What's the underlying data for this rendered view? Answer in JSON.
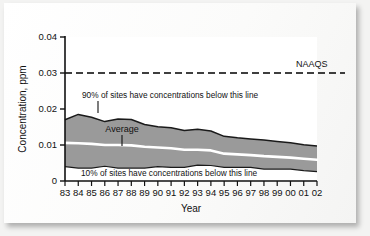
{
  "figure": {
    "background_color": "#f3f3f2",
    "card_color": "#fdfdfd",
    "plot_background": "#ffffff"
  },
  "chart_data": {
    "type": "area",
    "title": "",
    "subtitle": "",
    "xlabel": "Year",
    "ylabel": "Concentration, ppm",
    "xlim": [
      83,
      102
    ],
    "ylim": [
      0,
      0.04
    ],
    "grid": false,
    "legend_position": "none",
    "x": [
      "83",
      "84",
      "85",
      "86",
      "87",
      "88",
      "89",
      "90",
      "91",
      "92",
      "93",
      "94",
      "95",
      "96",
      "97",
      "98",
      "99",
      "00",
      "01",
      "02"
    ],
    "x_numeric": [
      1983,
      1984,
      1985,
      1986,
      1987,
      1988,
      1989,
      1990,
      1991,
      1992,
      1993,
      1994,
      1995,
      1996,
      1997,
      1998,
      1999,
      2000,
      2001,
      2002
    ],
    "y_ticks": [
      "0",
      "0.01",
      "0.02",
      "0.03",
      "0.04"
    ],
    "y_tick_values": [
      0,
      0.01,
      0.02,
      0.03,
      0.04
    ],
    "band_fill_color": "#9a9a9a",
    "band_edge_color": "#1a1a1a",
    "average_line_color": "#ffffff",
    "series": [
      {
        "name": "90% of sites have concentrations below this line",
        "role": "upper-percentile",
        "values": [
          0.017,
          0.0185,
          0.0177,
          0.0165,
          0.0172,
          0.0171,
          0.0157,
          0.0151,
          0.0148,
          0.014,
          0.0144,
          0.0139,
          0.0124,
          0.012,
          0.0117,
          0.0114,
          0.011,
          0.0106,
          0.0101,
          0.0097
        ]
      },
      {
        "name": "Average",
        "role": "mean",
        "values": [
          0.0106,
          0.0105,
          0.0103,
          0.01,
          0.01,
          0.0099,
          0.0095,
          0.0093,
          0.0091,
          0.0087,
          0.0087,
          0.0085,
          0.0076,
          0.0074,
          0.0072,
          0.0069,
          0.0067,
          0.0065,
          0.0062,
          0.0059
        ]
      },
      {
        "name": "10% of sites have concentrations below this line",
        "role": "lower-percentile",
        "values": [
          0.004,
          0.0036,
          0.0036,
          0.0041,
          0.0036,
          0.0036,
          0.0036,
          0.004,
          0.0038,
          0.0038,
          0.0044,
          0.0043,
          0.0038,
          0.0038,
          0.0038,
          0.0033,
          0.0033,
          0.0033,
          0.0029,
          0.0026
        ]
      }
    ],
    "reference_lines": [
      {
        "name": "NAAQS",
        "label": "NAAQS",
        "value": 0.03,
        "style": "dashed",
        "color": "#000000"
      }
    ],
    "annotations": [
      {
        "name": "upper-percentile-annotation",
        "text": "90% of sites have concentrations below this line",
        "points_to_year": "86",
        "points_to_value": 0.0165
      },
      {
        "name": "average-annotation",
        "text": "Average",
        "points_to_year": "86",
        "points_to_value": 0.01
      },
      {
        "name": "lower-percentile-annotation",
        "text": "10% of sites have concentrations below this line",
        "points_to_year": "",
        "points_to_value": 0.002
      }
    ]
  },
  "axes": {
    "y_title": "Concentration, ppm",
    "x_title": "Year",
    "y_labels": [
      "0.04",
      "0.03",
      "0.02",
      "0.01",
      "0"
    ],
    "x_labels": [
      "83",
      "84",
      "85",
      "86",
      "87",
      "88",
      "89",
      "90",
      "91",
      "92",
      "93",
      "94",
      "95",
      "96",
      "97",
      "98",
      "99",
      "00",
      "01",
      "02"
    ]
  },
  "labels": {
    "naaqs": "NAAQS",
    "average": "Average",
    "upper_note": "90% of sites have concentrations below this line",
    "lower_note": "10% of sites have concentrations below this line"
  }
}
